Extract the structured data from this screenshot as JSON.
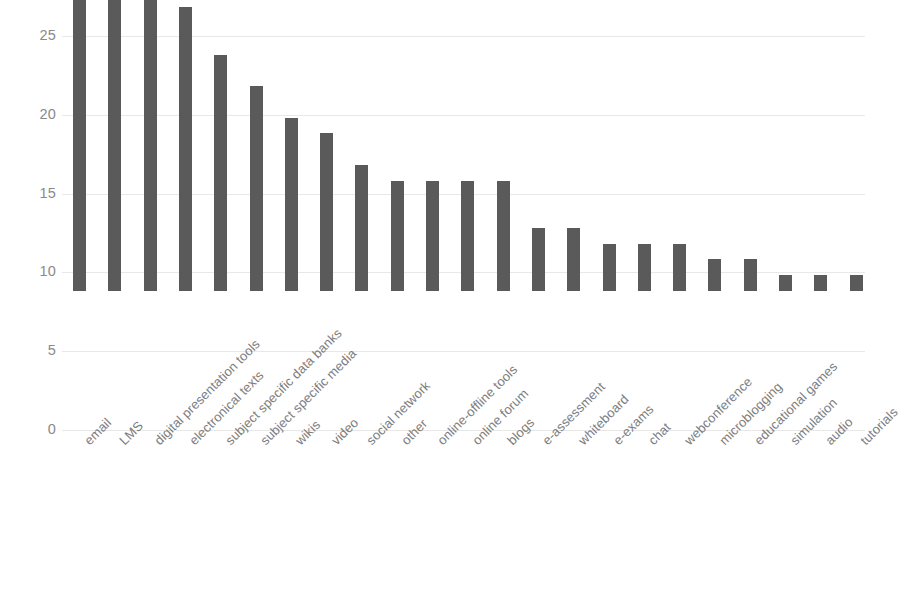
{
  "chart_data": {
    "type": "bar",
    "title": "",
    "subtitle": "",
    "xlabel": "",
    "ylabel": "",
    "ylim": [
      0,
      25
    ],
    "yticks": [
      0,
      5,
      10,
      15,
      20,
      25
    ],
    "grid": true,
    "legend": false,
    "legend_position": "none",
    "orientation": "vertical",
    "bar_color": "#5a5a5a",
    "gridline_color": "#e8e8e8",
    "tick_label_color": "#8a8a8a",
    "categories": [
      "email",
      "LMS",
      "digital presentation tools",
      "electronical texts",
      "subject specific data banks",
      "subject specific media",
      "wikis",
      "video",
      "social network",
      "other",
      "online-offline tools",
      "online forum",
      "blogs",
      "e-assessment",
      "whiteboard",
      "e-exams",
      "chat",
      "webconference",
      "microblogging",
      "educational games",
      "simulation",
      "audio",
      "tutorials"
    ],
    "values": [
      22,
      21,
      19,
      18,
      15,
      13,
      11,
      10,
      8,
      7,
      7,
      7,
      7,
      4,
      4,
      3,
      3,
      3,
      2,
      2,
      1,
      1,
      1
    ]
  }
}
